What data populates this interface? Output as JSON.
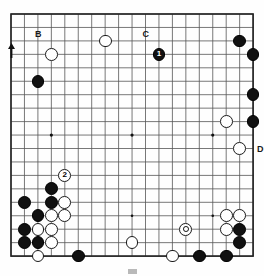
{
  "diagram": {
    "board_size": 19,
    "geometry": {
      "origin_x": 11,
      "origin_y": 14,
      "spacing": 13.45,
      "stone_radius": 6.4,
      "line_color": "#555555",
      "edge_color": "#222222",
      "background_color": "#fefefe",
      "black_color": "#111111",
      "white_color": "#ffffff"
    },
    "star_points": [
      {
        "col": 3,
        "row": 3
      },
      {
        "col": 9,
        "row": 3
      },
      {
        "col": 15,
        "row": 3
      },
      {
        "col": 3,
        "row": 9
      },
      {
        "col": 9,
        "row": 9
      },
      {
        "col": 15,
        "row": 9
      },
      {
        "col": 3,
        "row": 15
      },
      {
        "col": 9,
        "row": 15
      },
      {
        "col": 15,
        "row": 15
      }
    ],
    "stones": [
      {
        "col": 7,
        "row": 2,
        "color": "white",
        "number": "",
        "marked": false
      },
      {
        "col": 17,
        "row": 2,
        "color": "black",
        "number": "",
        "marked": false
      },
      {
        "col": 3,
        "row": 3,
        "color": "white",
        "number": "",
        "marked": false
      },
      {
        "col": 11,
        "row": 3,
        "color": "black",
        "number": "1",
        "marked": false
      },
      {
        "col": 18,
        "row": 3,
        "color": "black",
        "number": "",
        "marked": false
      },
      {
        "col": 2,
        "row": 5,
        "color": "black",
        "number": "",
        "marked": false
      },
      {
        "col": 18,
        "row": 6,
        "color": "black",
        "number": "",
        "marked": false
      },
      {
        "col": 16,
        "row": 8,
        "color": "white",
        "number": "",
        "marked": false
      },
      {
        "col": 18,
        "row": 8,
        "color": "black",
        "number": "",
        "marked": false
      },
      {
        "col": 17,
        "row": 10,
        "color": "white",
        "number": "",
        "marked": false
      },
      {
        "col": 4,
        "row": 12,
        "color": "white",
        "number": "2",
        "marked": false
      },
      {
        "col": 3,
        "row": 13,
        "color": "black",
        "number": "",
        "marked": false
      },
      {
        "col": 1,
        "row": 14,
        "color": "black",
        "number": "",
        "marked": false
      },
      {
        "col": 3,
        "row": 14,
        "color": "black",
        "number": "",
        "marked": false
      },
      {
        "col": 4,
        "row": 14,
        "color": "white",
        "number": "",
        "marked": false
      },
      {
        "col": 2,
        "row": 15,
        "color": "black",
        "number": "",
        "marked": false
      },
      {
        "col": 3,
        "row": 15,
        "color": "white",
        "number": "",
        "marked": false
      },
      {
        "col": 4,
        "row": 15,
        "color": "white",
        "number": "",
        "marked": false
      },
      {
        "col": 1,
        "row": 16,
        "color": "black",
        "number": "",
        "marked": false
      },
      {
        "col": 2,
        "row": 16,
        "color": "white",
        "number": "",
        "marked": false
      },
      {
        "col": 3,
        "row": 16,
        "color": "white",
        "number": "",
        "marked": false
      },
      {
        "col": 1,
        "row": 17,
        "color": "black",
        "number": "",
        "marked": false
      },
      {
        "col": 2,
        "row": 17,
        "color": "black",
        "number": "",
        "marked": false
      },
      {
        "col": 3,
        "row": 17,
        "color": "white",
        "number": "",
        "marked": false
      },
      {
        "col": 2,
        "row": 18,
        "color": "white",
        "number": "",
        "marked": false
      },
      {
        "col": 5,
        "row": 18,
        "color": "black",
        "number": "",
        "marked": false
      },
      {
        "col": 9,
        "row": 17,
        "color": "white",
        "number": "",
        "marked": false
      },
      {
        "col": 13,
        "row": 16,
        "color": "white",
        "number": "",
        "marked": true
      },
      {
        "col": 16,
        "row": 15,
        "color": "white",
        "number": "",
        "marked": false
      },
      {
        "col": 17,
        "row": 15,
        "color": "white",
        "number": "",
        "marked": false
      },
      {
        "col": 16,
        "row": 16,
        "color": "white",
        "number": "",
        "marked": false
      },
      {
        "col": 17,
        "row": 16,
        "color": "black",
        "number": "",
        "marked": false
      },
      {
        "col": 17,
        "row": 17,
        "color": "black",
        "number": "",
        "marked": false
      },
      {
        "col": 12,
        "row": 18,
        "color": "white",
        "number": "",
        "marked": false
      },
      {
        "col": 14,
        "row": 18,
        "color": "black",
        "number": "",
        "marked": false
      },
      {
        "col": 16,
        "row": 18,
        "color": "black",
        "number": "",
        "marked": false
      }
    ],
    "point_labels": [
      {
        "text": "B",
        "col": 2,
        "row": 2,
        "dx": -3,
        "dy": -11
      },
      {
        "text": "C",
        "col": 10,
        "row": 2,
        "dx": -3,
        "dy": -11
      },
      {
        "text": "D",
        "col": 18,
        "row": 10,
        "dx": 4,
        "dy": -4
      },
      {
        "text": "A",
        "col": 0,
        "row": 3,
        "dx": -3,
        "dy": -11
      }
    ],
    "arrow_marker": {
      "name": "A",
      "col": 0,
      "row": 3,
      "description": "upward arrow pointing to point A"
    }
  }
}
